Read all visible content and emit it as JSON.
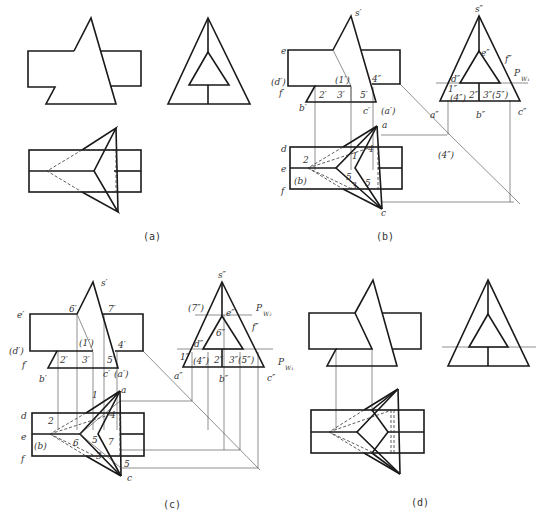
{
  "figure": {
    "panels": [
      {
        "id": "a",
        "caption": "(a)"
      },
      {
        "id": "b",
        "caption": "(b)"
      },
      {
        "id": "c",
        "caption": "(c)"
      },
      {
        "id": "d",
        "caption": "(d)"
      }
    ]
  },
  "labels_b": {
    "s1": "s′",
    "e1": "e",
    "d1": "(d′)",
    "f1": "f′",
    "b1": "b′",
    "p1": "(1′)",
    "p2": "2′",
    "p3": "3′",
    "p4": "4″",
    "p5": "5′",
    "c1": "c′",
    "a1": "(a′)",
    "s2": "s″",
    "e2": "e″",
    "f2": "f″",
    "d2": "d″",
    "pw": "P",
    "pw_sub": "W₁",
    "q1": "1″",
    "q4": "(4″)",
    "q2": "2″",
    "q35": "3″(5″)",
    "a2": "a″",
    "b2": "b″",
    "c2": "c″",
    "q4b": "(4″)",
    "a": "a",
    "d": "d",
    "e": "e",
    "f": "f",
    "b": "(b)",
    "c": "c",
    "t1": "1",
    "t2": "2",
    "t3": "3",
    "t4": "4",
    "t5": "5",
    "t5b": "5"
  },
  "labels_c": {
    "s1": "s′",
    "e1": "e′",
    "d1": "(d′)",
    "f1": "f′",
    "b1": "b′",
    "p6": "6′",
    "p7": "7′",
    "p1": "(1′)",
    "p2": "2′",
    "p3": "3′",
    "p4": "4′",
    "p5": "5′",
    "c1": "c′",
    "a1": "(a′)",
    "s2": "s″",
    "q7": "(7″)",
    "e2": "e″",
    "pw2": "P",
    "pw2_sub": "W₂",
    "q6": "6″",
    "f2": "f″",
    "d2": "d″",
    "q1": "1″",
    "q4": "(4″)",
    "q2": "2″",
    "q35": "3″(5″)",
    "pw1": "P",
    "pw1_sub": "W₁",
    "a2": "a″",
    "b2": "b″",
    "c2": "c″",
    "a": "a",
    "d": "d",
    "e": "e",
    "f": "f",
    "b": "(b)",
    "c": "c",
    "t1": "1",
    "t2": "2",
    "t3": "3",
    "t4": "4",
    "t5": "5",
    "t6": "6",
    "t7": "7",
    "t5b": "5"
  }
}
